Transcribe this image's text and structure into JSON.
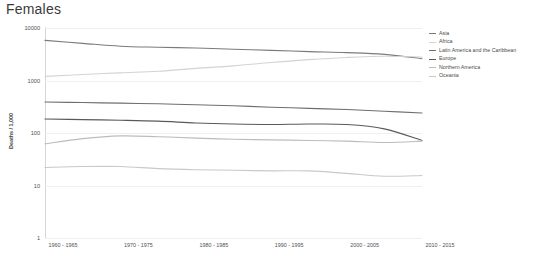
{
  "chart_data": {
    "type": "line",
    "title": "Females",
    "xlabel": "",
    "ylabel": "Deaths / 1,000",
    "yscale": "log",
    "ylim": [
      1,
      10000
    ],
    "yticks": [
      10000,
      1000,
      100,
      10,
      1
    ],
    "ytick_labels": [
      "10000",
      "1000",
      "100",
      "10",
      "1"
    ],
    "grid": true,
    "legend_position": "right",
    "categories": [
      "1960 - 1965",
      "1965 - 1970",
      "1970 - 1975",
      "1975 - 1980",
      "1980 - 1985",
      "1985 - 1990",
      "1990 - 1995",
      "1995 - 2000",
      "2000 - 2005",
      "2005 - 2010",
      "2010 - 2015"
    ],
    "xtick_labels": [
      "1960 - 1965",
      "1970 - 1975",
      "1980 - 1985",
      "1990 - 1995",
      "2000 - 2005",
      "2010 - 2015"
    ],
    "xtick_indices": [
      0,
      2,
      4,
      6,
      8,
      10
    ],
    "series": [
      {
        "name": "Asia",
        "color": "#7b7b7b",
        "values": [
          5800,
          5100,
          4500,
          4300,
          4150,
          3950,
          3750,
          3550,
          3400,
          3150,
          2600
        ]
      },
      {
        "name": "Africa",
        "color": "#d3d3d3",
        "values": [
          1200,
          1300,
          1400,
          1500,
          1700,
          1900,
          2200,
          2500,
          2750,
          2900,
          2800
        ]
      },
      {
        "name": "Latin America and the Caribbean",
        "color": "#6f6f6f",
        "values": [
          390,
          380,
          370,
          360,
          345,
          330,
          310,
          295,
          280,
          260,
          240
        ]
      },
      {
        "name": "Europe",
        "color": "#5a5a5a",
        "values": [
          185,
          180,
          175,
          168,
          155,
          148,
          145,
          148,
          145,
          120,
          72
        ]
      },
      {
        "name": "Northern America",
        "color": "#bcbcbc",
        "values": [
          62,
          78,
          88,
          85,
          80,
          76,
          74,
          72,
          70,
          66,
          70
        ]
      },
      {
        "name": "Oceania",
        "color": "#c9c9c9",
        "values": [
          22,
          23,
          23,
          21,
          20,
          19.5,
          19,
          19,
          17,
          15,
          15.5
        ]
      }
    ]
  }
}
